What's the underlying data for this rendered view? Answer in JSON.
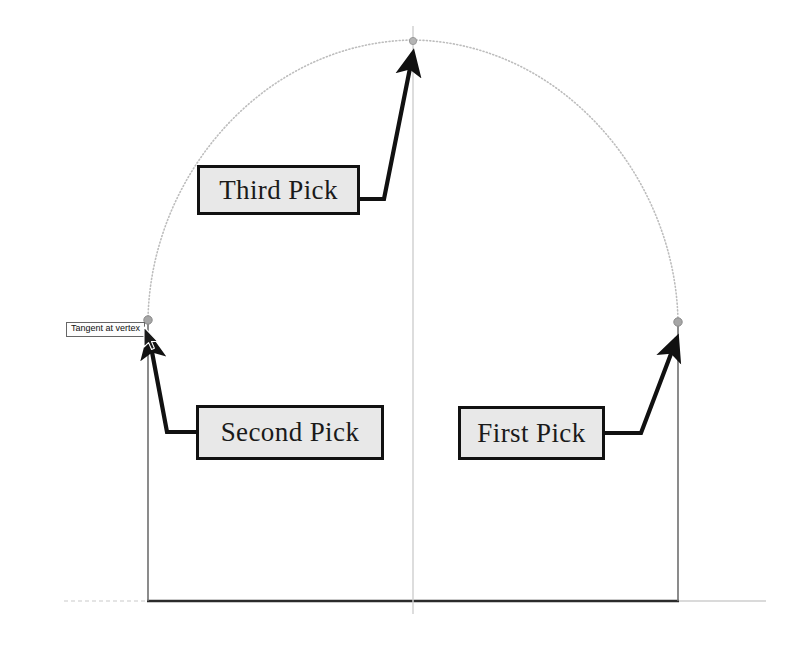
{
  "drawing": {
    "title": "Arc tangent pick sequence",
    "background_color": "#ffffff",
    "line_color": "#111111",
    "construction_color": "#b8b8b8",
    "box_fill_color": "#e8e8e8",
    "box_border_color": "#111111"
  },
  "tooltip": {
    "text": "Tangent at vertex"
  },
  "callouts": [
    {
      "id": "third-pick",
      "label": "Third Pick",
      "target": "arc-apex"
    },
    {
      "id": "second-pick",
      "label": "Second Pick",
      "target": "left-vertex-grip"
    },
    {
      "id": "first-pick",
      "label": "First Pick",
      "target": "right-vertex-grip"
    }
  ],
  "geometry": {
    "left_vertex": {
      "x": 148,
      "y": 320
    },
    "right_vertex": {
      "x": 678,
      "y": 322
    },
    "apex": {
      "x": 413,
      "y": 40
    },
    "baseline_y": 601,
    "centerline_x": 413,
    "grip_color": "#9a9a9a",
    "grip_count": 3
  },
  "icons": {
    "cursor": "mouse-cursor-icon",
    "grip": "grip-node-icon"
  }
}
